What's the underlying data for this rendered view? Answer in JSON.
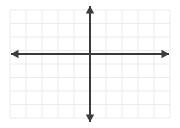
{
  "figure": {
    "type": "coordinate-plane",
    "title": "",
    "background_color": "#ffffff",
    "width": 180,
    "height": 128
  },
  "grid": {
    "visible": true,
    "line_color": "#ebebeb",
    "line_width": 1,
    "left": 10,
    "right": 170,
    "top": 10,
    "bottom": 118,
    "columns": 10,
    "rows": 8,
    "cell_width": 16,
    "cell_height": 13.5
  },
  "axes": {
    "color": "#3b3b3b",
    "line_width": 2,
    "origin_x": 90,
    "origin_y": 54,
    "arrowheads": true,
    "x_axis": {
      "label": "",
      "start_x": 11,
      "end_x": 169,
      "y": 54,
      "left_arrow": true,
      "right_arrow": true,
      "tick_labels": [],
      "range": [
        -5,
        5
      ]
    },
    "y_axis": {
      "label": "",
      "x": 90,
      "start_y": 6,
      "end_y": 122,
      "up_arrow": true,
      "down_arrow": true,
      "tick_labels": [],
      "range": [
        -4,
        4
      ]
    }
  },
  "chart_data": {
    "type": "scatter",
    "title": "",
    "xlabel": "",
    "ylabel": "",
    "xlim": [
      -5,
      5
    ],
    "ylim": [
      -4,
      4
    ],
    "grid": true,
    "series": [],
    "annotations": []
  }
}
